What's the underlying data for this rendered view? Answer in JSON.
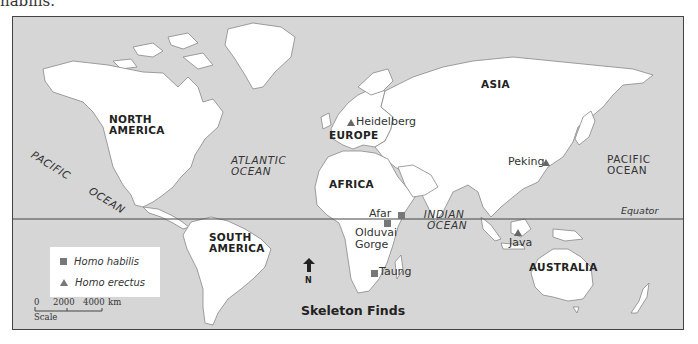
{
  "caption_fragment": "habilis.",
  "map": {
    "title": "Skeleton Finds",
    "equator_label": "Equator",
    "north_label": "N",
    "colors": {
      "ocean": "#d6d6d6",
      "land": "#ffffff",
      "marker": "#777777",
      "frame": "#444444"
    },
    "continents": [
      {
        "id": "north-america",
        "line1": "NORTH",
        "line2": "AMERICA"
      },
      {
        "id": "south-america",
        "line1": "SOUTH",
        "line2": "AMERICA"
      },
      {
        "id": "europe",
        "line1": "EUROPE"
      },
      {
        "id": "africa",
        "line1": "AFRICA"
      },
      {
        "id": "asia",
        "line1": "ASIA"
      },
      {
        "id": "australia",
        "line1": "AUSTRALIA"
      }
    ],
    "oceans": [
      {
        "id": "pacific-west",
        "line1": "PACIFIC",
        "line2": "OCEAN"
      },
      {
        "id": "atlantic",
        "line1": "ATLANTIC",
        "line2": "OCEAN"
      },
      {
        "id": "indian",
        "line1": "INDIAN",
        "line2": "OCEAN"
      },
      {
        "id": "pacific-east",
        "line1": "PACIFIC",
        "line2": "OCEAN"
      }
    ],
    "sites": [
      {
        "name": "Heidelberg",
        "species": "Homo erectus",
        "marker": "triangle"
      },
      {
        "name": "Peking",
        "species": "Homo erectus",
        "marker": "triangle"
      },
      {
        "name": "Java",
        "species": "Homo erectus",
        "marker": "triangle"
      },
      {
        "name": "Afar",
        "species": "Homo habilis",
        "marker": "square"
      },
      {
        "name": "Olduvai",
        "name_line2": "Gorge",
        "species": "Homo habilis",
        "marker": "square"
      },
      {
        "name": "Taung",
        "species": "Homo habilis",
        "marker": "square"
      }
    ],
    "legend": [
      {
        "marker": "square",
        "label": "Homo habilis"
      },
      {
        "marker": "triangle",
        "label": "Homo erectus"
      }
    ],
    "scale": {
      "ticks": [
        "0",
        "2000",
        "4000"
      ],
      "unit": "km",
      "label": "Scale"
    }
  }
}
